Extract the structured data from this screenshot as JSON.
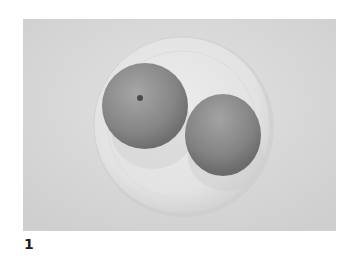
{
  "figure": {
    "caption_number": "1",
    "colors": {
      "background": "#d9d9d9",
      "plate": "#e6e6e6",
      "fruit": "#8c8c8c"
    }
  }
}
